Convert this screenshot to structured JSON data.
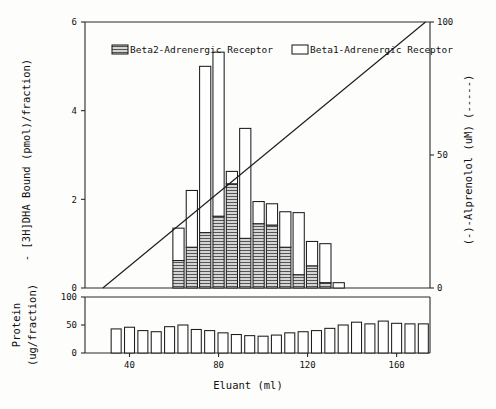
{
  "axes": {
    "x_label": "Eluant (ml)",
    "x_ticks": [
      "40",
      "80",
      "120",
      "160"
    ],
    "left_top_label": "- [3H]DHA Bound  (pmol)/fraction)",
    "left_top_ticks": [
      "0",
      "2",
      "4",
      "6"
    ],
    "right_label": "(-)-Alprenolol  (uM)   (-----)",
    "right_ticks": [
      "0",
      "50",
      "100"
    ],
    "left_bottom_label_1": "Protein",
    "left_bottom_label_2": "(ug/fraction)",
    "left_bottom_ticks": [
      "0",
      "50",
      "100"
    ]
  },
  "legend": {
    "items": [
      {
        "label": "Beta2-Adrenergic Receptor",
        "swatch": "hatched"
      },
      {
        "label": "Beta1-Adrenergic Receptor",
        "swatch": "white"
      }
    ]
  },
  "colors": {
    "ink": "#1d1d1d",
    "background": "#fdfdfb",
    "bar_fill": "#ffffff",
    "hatch": "#555555"
  },
  "chart_data": {
    "type": "bar",
    "title": "",
    "xlabel": "Eluant (ml)",
    "ylabel": "- [3H]DHA Bound (pmol)/fraction)",
    "xlim": [
      20,
      175
    ],
    "ylim": [
      0,
      6
    ],
    "grid": false,
    "legend_position": "top-inside",
    "stacked": true,
    "panels": [
      {
        "name": "receptor-binding",
        "ylabel": "- [3H]DHA Bound (pmol)/fraction)",
        "ylim": [
          0,
          6
        ],
        "yticks": [
          0,
          2,
          4,
          6
        ],
        "x": [
          62,
          68,
          74,
          80,
          86,
          92,
          98,
          104,
          110,
          116,
          122,
          128,
          134
        ],
        "series": [
          {
            "name": "Beta2-Adrenergic Receptor",
            "fill": "hatched",
            "values": [
              0.62,
              0.92,
              1.25,
              1.62,
              2.35,
              1.12,
              1.45,
              1.42,
              0.92,
              0.3,
              0.5,
              0.12,
              0.0
            ]
          },
          {
            "name": "Beta1-Adrenergic Receptor",
            "fill": "white",
            "values": [
              0.73,
              1.28,
              3.75,
              3.7,
              0.28,
              2.48,
              0.5,
              0.48,
              0.8,
              1.4,
              0.55,
              0.88,
              0.12
            ]
          }
        ],
        "totals": [
          1.35,
          2.2,
          5.0,
          5.32,
          2.63,
          3.6,
          1.95,
          1.9,
          1.72,
          1.7,
          1.05,
          1.0,
          0.12
        ]
      },
      {
        "name": "alprenolol-gradient",
        "type": "line",
        "ylabel": "(-)-Alprenolol (uM) (-----)",
        "ylim": [
          0,
          100
        ],
        "yticks": [
          0,
          50,
          100
        ],
        "x": [
          28,
          173
        ],
        "values": [
          0,
          100
        ]
      },
      {
        "name": "protein",
        "type": "bar",
        "ylabel": "Protein (ug/fraction)",
        "ylim": [
          0,
          100
        ],
        "yticks": [
          0,
          50,
          100
        ],
        "x": [
          34,
          40,
          46,
          52,
          58,
          64,
          70,
          76,
          82,
          88,
          94,
          100,
          106,
          112,
          118,
          124,
          130,
          136,
          142,
          148,
          154,
          160,
          166,
          172
        ],
        "values": [
          43,
          46,
          40,
          38,
          47,
          50,
          42,
          40,
          36,
          33,
          31,
          30,
          32,
          36,
          38,
          40,
          44,
          50,
          55,
          52,
          57,
          53,
          52,
          52
        ]
      }
    ]
  }
}
